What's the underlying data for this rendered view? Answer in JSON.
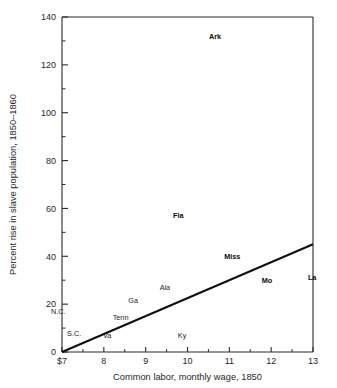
{
  "chart_data": {
    "type": "scatter",
    "title": "",
    "xlabel": "Common labor, monthly wage, 1850",
    "ylabel": "Percent rise in slave population, 1850–1860",
    "xlim": [
      7,
      13
    ],
    "ylim": [
      0,
      140
    ],
    "grid": false,
    "legend": "none",
    "x_ticks": [
      "$7",
      "8",
      "9",
      "10",
      "11",
      "12",
      "13"
    ],
    "x_tick_values": [
      7,
      8,
      9,
      10,
      11,
      12,
      13
    ],
    "x_minor_ticks": [
      7.5,
      8.5,
      9.5,
      10.5,
      11.5,
      12.5
    ],
    "y_ticks": [
      "0",
      "20",
      "40",
      "60",
      "80",
      "100",
      "120",
      "140"
    ],
    "y_tick_values": [
      0,
      20,
      40,
      60,
      80,
      100,
      120,
      140
    ],
    "y_minor_ticks": [
      10,
      30,
      50,
      70,
      90,
      110,
      130
    ],
    "points": [
      {
        "label": "Ark",
        "x": 10.66,
        "y": 131.0,
        "bold": true
      },
      {
        "label": "Fla",
        "x": 9.78,
        "y": 56.0,
        "bold": true
      },
      {
        "label": "Miss",
        "x": 11.07,
        "y": 39.0,
        "bold": true
      },
      {
        "label": "La",
        "x": 12.98,
        "y": 30.0,
        "bold": true
      },
      {
        "label": "Mo",
        "x": 11.9,
        "y": 29.0,
        "bold": true
      },
      {
        "label": "Ala",
        "x": 9.46,
        "y": 26.0,
        "bold": false
      },
      {
        "label": "Ga",
        "x": 8.7,
        "y": 20.5,
        "bold": false
      },
      {
        "label": "N.C.",
        "x": 6.91,
        "y": 16.0,
        "bold": false
      },
      {
        "label": "Tenn",
        "x": 8.4,
        "y": 13.4,
        "bold": false
      },
      {
        "label": "S.C.",
        "x": 7.29,
        "y": 6.7,
        "bold": false
      },
      {
        "label": "Va",
        "x": 8.08,
        "y": 5.9,
        "bold": false
      },
      {
        "label": "Ky",
        "x": 9.87,
        "y": 5.9,
        "bold": false
      }
    ],
    "trend_line": {
      "name": "regression-line",
      "x_start": 7,
      "y_start": 0,
      "x_end": 13,
      "y_end": 45
    }
  },
  "geometry": {
    "plot_left": 62,
    "plot_right": 313,
    "plot_top": 17,
    "plot_bottom": 352
  }
}
